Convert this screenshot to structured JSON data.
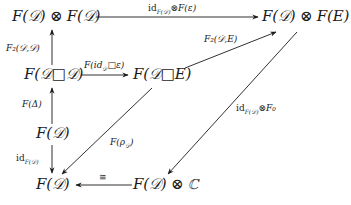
{
  "diagram": {
    "type": "commutative-diagram",
    "nodes": {
      "top_left": "F(𝒟) ⊗ F(𝒟)",
      "top_right": "F(𝒟) ⊗ F(E)",
      "mid_left": "F(𝒟□𝒟)",
      "mid_center": "F(𝒟□E)",
      "lower_left": "F(𝒟)",
      "bottom_left": "F(𝒟)",
      "bottom_center": "F(𝒟) ⊗ ℂ"
    },
    "arrows": [
      {
        "from": "top_left",
        "to": "top_right",
        "label": "id_F(𝒟)⊗F(ε)"
      },
      {
        "from": "mid_left",
        "to": "top_left",
        "label": "F₂(𝒟,𝒟)"
      },
      {
        "from": "mid_left",
        "to": "mid_center",
        "label": "F(id_𝒟□ε)"
      },
      {
        "from": "mid_center",
        "to": "top_right",
        "label": "F₂(𝒟,E)"
      },
      {
        "from": "lower_left",
        "to": "mid_left",
        "label": "F(Δ)"
      },
      {
        "from": "lower_left",
        "to": "bottom_left",
        "label": "id_F(𝒟)"
      },
      {
        "from": "mid_center",
        "to": "bottom_left",
        "label": "F(ρ_𝒟)"
      },
      {
        "from": "top_right",
        "to": "bottom_center",
        "label": "id_F(𝒟)⊗F₀"
      },
      {
        "from": "bottom_center",
        "to": "bottom_left",
        "label": "≅"
      }
    ],
    "labels": {
      "top_arrow": "id",
      "top_arrow_sub": "F(𝒟)",
      "top_arrow_rest": "⊗F(ε)",
      "f2_dd": "F₂(𝒟,𝒟)",
      "f2_de": "F₂(𝒟,E)",
      "mid_arrow_pre": "F(id",
      "mid_arrow_sub": "𝒟",
      "mid_arrow_post": "□ε)",
      "f_delta": "F(Δ)",
      "id_left": "id",
      "id_left_sub": "F(𝒟)",
      "f_rho_pre": "F(ρ",
      "f_rho_sub": "𝒟",
      "f_rho_post": ")",
      "diag_right": "id",
      "diag_right_sub": "F(𝒟)",
      "diag_right_rest": "⊗F₀",
      "iso": "≅"
    }
  }
}
